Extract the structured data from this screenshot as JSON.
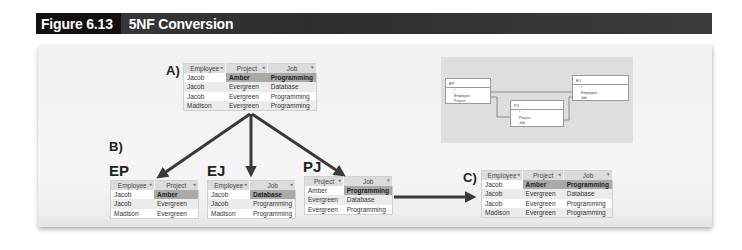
{
  "figure": {
    "number": "Figure 6.13",
    "title": "5NF Conversion"
  },
  "labels": {
    "a": "A)",
    "b": "B)",
    "c": "C)",
    "ep": "EP",
    "ej": "EJ",
    "pj": "PJ"
  },
  "table_a": {
    "columns": [
      "Employee",
      "Project",
      "Job"
    ],
    "sort_glyphs": [
      "◂",
      "◂",
      "▾"
    ],
    "rows": [
      [
        "Jacob",
        "Amber",
        "Programming"
      ],
      [
        "Jacob",
        "Evergreen",
        "Database"
      ],
      [
        "Jacob",
        "Evergreen",
        "Programming"
      ],
      [
        "Madison",
        "Evergreen",
        "Programming"
      ]
    ]
  },
  "table_ep": {
    "columns": [
      "Employee",
      "Project"
    ],
    "sort_glyphs": [
      "◂",
      "◂"
    ],
    "rows": [
      [
        "Jacob",
        "Amber"
      ],
      [
        "Jacob",
        "Evergreen"
      ],
      [
        "Madison",
        "Evergreen"
      ]
    ]
  },
  "table_ej": {
    "columns": [
      "Employee",
      "Job"
    ],
    "sort_glyphs": [
      "◂",
      "◂"
    ],
    "rows": [
      [
        "Jacob",
        "Database"
      ],
      [
        "Jacob",
        "Programming"
      ],
      [
        "Madison",
        "Programming"
      ]
    ]
  },
  "table_pj": {
    "columns": [
      "Project",
      "Job"
    ],
    "sort_glyphs": [
      "◂",
      "▾"
    ],
    "rows": [
      [
        "Amber",
        "Programming"
      ],
      [
        "Evergreen",
        "Database"
      ],
      [
        "Evergreen",
        "Programming"
      ]
    ]
  },
  "table_c": {
    "columns": [
      "Employee",
      "Project",
      "Job"
    ],
    "sort_glyphs": [
      "◂",
      "◂",
      "▾"
    ],
    "rows": [
      [
        "Jacob",
        "Amber",
        "Programming"
      ],
      [
        "Jacob",
        "Evergreen",
        "Database"
      ],
      [
        "Jacob",
        "Evergreen",
        "Programming"
      ],
      [
        "Madison",
        "Evergreen",
        "Programming"
      ]
    ]
  },
  "erd": {
    "ep": {
      "name": "EP",
      "key": "*",
      "fields": [
        "Employee",
        "Project"
      ]
    },
    "ej": {
      "name": "EJ",
      "key": "*",
      "fields": [
        "Employee",
        "Job"
      ]
    },
    "pj": {
      "name": "PJ",
      "key": "*",
      "fields": [
        "Project",
        "Job"
      ]
    }
  },
  "colors": {
    "header_black": "#111111",
    "header_gray": "#333333",
    "arrow": "#3a3a3a",
    "highlight_cell": "#a9a9a9",
    "table_header": "#dcdcdc"
  }
}
